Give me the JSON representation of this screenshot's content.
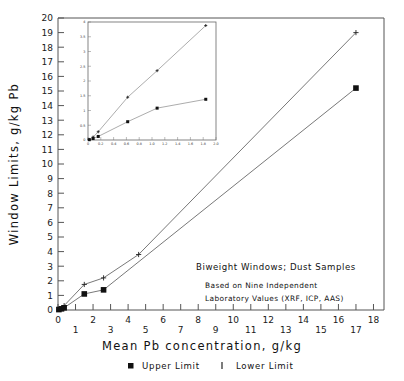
{
  "chart_data": {
    "type": "line",
    "title": "",
    "xlabel": "Mean Pb concentration, g/kg",
    "ylabel": "Window Limits, g/kg Pb",
    "xlim": [
      0,
      18.6
    ],
    "ylim": [
      0,
      20
    ],
    "grid": false,
    "legend_position": "below-axis",
    "xticks": [
      0,
      1,
      2,
      3,
      4,
      5,
      6,
      7,
      8,
      9,
      10,
      11,
      12,
      13,
      14,
      15,
      16,
      17,
      18
    ],
    "xtick_labels_upper": [
      "0",
      "2",
      "4",
      "6",
      "8",
      "10",
      "12",
      "14",
      "16",
      "18"
    ],
    "xtick_labels_lower": [
      "1",
      "3",
      "5",
      "7",
      "9",
      "11",
      "13",
      "15",
      "17"
    ],
    "yticks": [
      0,
      1,
      2,
      3,
      4,
      5,
      6,
      7,
      8,
      9,
      10,
      11,
      12,
      13,
      14,
      15,
      16,
      17,
      18,
      19,
      20
    ],
    "ytick_labels": [
      "0",
      "1",
      "2",
      "3",
      "4",
      "5",
      "6",
      "7",
      "8",
      "9",
      "10",
      "11",
      "12",
      "13",
      "14",
      "15",
      "16",
      "17",
      "18",
      "19",
      "20"
    ],
    "series": [
      {
        "name": "Lower Limit",
        "marker": "plus",
        "x": [
          0.05,
          0.2,
          0.35,
          1.5,
          2.6,
          4.6,
          17.0
        ],
        "y": [
          0.05,
          0.12,
          0.3,
          1.75,
          2.2,
          3.8,
          19.0
        ]
      },
      {
        "name": "Upper Limit",
        "marker": "square",
        "x": [
          0.05,
          0.2,
          0.35,
          1.5,
          2.6,
          17.0
        ],
        "y": [
          0.03,
          0.08,
          0.15,
          1.1,
          1.38,
          15.2
        ]
      }
    ],
    "annotations": [
      "Biweight Windows; Dust Samples",
      "Based on Nine Independent",
      "Laboratory Values (XRF, ICP, AAS)"
    ],
    "inset": {
      "type": "line",
      "xlim": [
        0,
        2.0
      ],
      "ylim": [
        0,
        4.0
      ],
      "xticks": [
        0,
        0.2,
        0.4,
        0.6,
        0.8,
        1.0,
        1.2,
        1.4,
        1.6,
        1.8,
        2.0
      ],
      "xtick_labels": [
        "0",
        "0.2",
        "0.4",
        "0.6",
        "0.8",
        "1.0",
        "1.2",
        "1.4",
        "1.6",
        "1.8",
        "2.0"
      ],
      "yticks": [
        0,
        0.5,
        1.0,
        1.5,
        2.0,
        2.5,
        3.0,
        3.5,
        4.0
      ],
      "ytick_labels": [
        "0",
        "0.5",
        "1",
        "1.5",
        "2",
        "2.5",
        "3",
        "3.5",
        "4"
      ],
      "series": [
        {
          "name": "Lower Limit",
          "marker": "plus",
          "x": [
            0.02,
            0.08,
            0.16,
            0.62,
            1.08,
            1.84
          ],
          "y": [
            0.02,
            0.1,
            0.28,
            1.45,
            2.35,
            3.88
          ]
        },
        {
          "name": "Upper Limit",
          "marker": "square",
          "x": [
            0.02,
            0.08,
            0.16,
            0.62,
            1.08,
            1.84
          ],
          "y": [
            0.01,
            0.05,
            0.12,
            0.62,
            1.08,
            1.38
          ]
        }
      ]
    }
  },
  "legend": {
    "items": [
      {
        "marker": "square",
        "label": "Upper Limit"
      },
      {
        "marker": "bar",
        "label": "Lower Limit"
      }
    ]
  }
}
